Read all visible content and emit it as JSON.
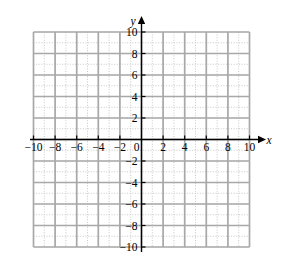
{
  "figure": {
    "name": "blank-cartesian-coordinate-plane",
    "background_color": "#ffffff"
  },
  "chart_data": {
    "type": "scatter",
    "title": "",
    "subtitle": "",
    "xlabel": "x",
    "ylabel": "y",
    "xlim": [
      -10,
      10
    ],
    "ylim": [
      -10,
      10
    ],
    "x_tick_labels": [
      "-10",
      "-8",
      "-6",
      "-4",
      "-2",
      "0",
      "2",
      "4",
      "6",
      "8",
      "10"
    ],
    "x_tick_values": [
      -10,
      -8,
      -6,
      -4,
      -2,
      0,
      2,
      4,
      6,
      8,
      10
    ],
    "y_tick_labels": [
      "10",
      "8",
      "6",
      "4",
      "2",
      "-2",
      "-4",
      "-6",
      "-8",
      "-10"
    ],
    "y_tick_values": [
      10,
      8,
      6,
      4,
      2,
      -2,
      -4,
      -6,
      -8,
      -10
    ],
    "origin_label": "0",
    "grid": true,
    "grid_minor_step": 1,
    "grid_major_step": 2,
    "legend": [],
    "annotations": [],
    "series": [],
    "values": [],
    "categories": []
  },
  "axes": {
    "x_axis_letter": "x",
    "y_axis_letter": "y",
    "x_arrow": "arrow-right",
    "y_arrow": "arrow-up",
    "axis_color": "#000000"
  },
  "grid": {
    "minor_line_color": "#c8c8c8",
    "major_line_color": "#a8a8a8"
  },
  "ticks": {
    "x_negative": [
      "-10",
      "-8",
      "-6",
      "-4",
      "-2"
    ],
    "x_origin": "0",
    "x_positive": [
      "2",
      "4",
      "6",
      "8",
      "10"
    ],
    "y_positive": [
      "10",
      "8",
      "6",
      "4",
      "2"
    ],
    "y_negative": [
      "-2",
      "-4",
      "-6",
      "-8",
      "-10"
    ]
  }
}
